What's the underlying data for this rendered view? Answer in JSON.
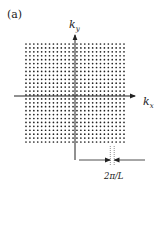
{
  "panel_label": "(a)",
  "axes": {
    "x_label_main": "k",
    "x_label_sub": "x",
    "y_label_main": "k",
    "y_label_sub": "y"
  },
  "lattice": {
    "columns": 26,
    "rows": 26,
    "x_start": 26,
    "y_start": 44,
    "spacing": 3.92,
    "dot_radius": 0.85,
    "dot_color": "#222222"
  },
  "spacing_annotation": {
    "label": "2π/L"
  },
  "colors": {
    "ink": "#222222",
    "background": "#ffffff"
  }
}
